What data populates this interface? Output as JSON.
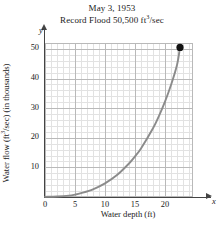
{
  "chart_data": {
    "type": "line",
    "title": "May 3, 1953",
    "subtitle": "Record Flood 50,500 ft3/sec",
    "subtitle_pre": "Record Flood 50,500 ft",
    "subtitle_sup": "3",
    "subtitle_post": "/sec",
    "xlabel": "Water depth (ft)",
    "ylabel": "Water flow (ft3/sec) (in thousands)",
    "ylabel_pre": "Water flow (ft",
    "ylabel_sup": "3",
    "ylabel_post": "/sec) (in thousands)",
    "x_axis_letter": "x",
    "y_axis_letter": "y",
    "xlim": [
      0,
      24.5
    ],
    "ylim": [
      0,
      52
    ],
    "xticks": [
      0,
      5,
      10,
      15,
      20
    ],
    "yticks": [
      10,
      20,
      30,
      40,
      50
    ],
    "grid": true,
    "grid_major_x": 5,
    "grid_major_y": 10,
    "grid_minor": true,
    "legend": null,
    "series": [
      {
        "name": "flood discharge curve",
        "x": [
          0,
          2,
          4,
          5,
          6,
          8,
          10,
          12,
          14,
          15,
          16,
          18,
          19,
          20,
          21,
          22,
          22.5
        ],
        "y": [
          0.05,
          0.15,
          0.45,
          0.8,
          1.3,
          2.6,
          4.6,
          7.4,
          11.3,
          13.7,
          16.4,
          23.2,
          27.4,
          32.2,
          37.8,
          44.6,
          50.5
        ]
      }
    ],
    "point_marker": {
      "label": "record flood point",
      "x": 22.5,
      "y": 50.5
    }
  },
  "ticks": {
    "x": [
      "0",
      "5",
      "10",
      "15",
      "20"
    ],
    "y": [
      "50",
      "40",
      "30",
      "20",
      "10"
    ]
  }
}
